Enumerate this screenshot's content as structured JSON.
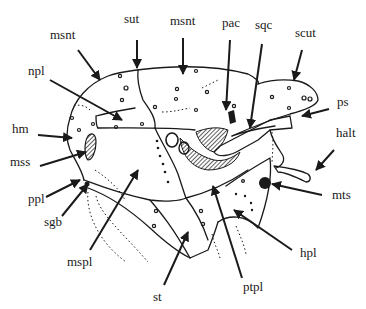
{
  "figure": {
    "colors": {
      "ink": "#1a1a1a",
      "background": "#ffffff"
    },
    "labels": {
      "sut": "sut",
      "msnt_left": "msnt",
      "msnt_top": "msnt",
      "pac": "pac",
      "sqc": "sqc",
      "scut": "scut",
      "npl": "npl",
      "ps": "ps",
      "hm": "hm",
      "halt": "halt",
      "mss": "mss",
      "ppl": "ppl",
      "sgb": "sgb",
      "mts": "mts",
      "hpl": "hpl",
      "mspl": "mspl",
      "st": "st",
      "ptpl": "ptpl"
    }
  }
}
